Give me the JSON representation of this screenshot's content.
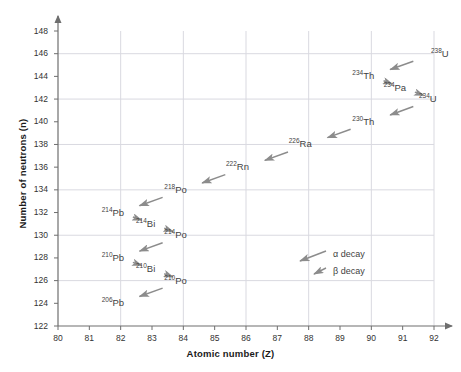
{
  "chart_data": {
    "type": "scatter",
    "title": "",
    "xlabel": "Atomic number (Z)",
    "ylabel": "Number of neutrons (n)",
    "xlim": [
      80,
      92
    ],
    "ylim": [
      122,
      148
    ],
    "xticks": [
      80,
      81,
      82,
      83,
      84,
      85,
      86,
      87,
      88,
      89,
      90,
      91,
      92
    ],
    "yticks": [
      122,
      124,
      126,
      128,
      130,
      132,
      134,
      136,
      138,
      140,
      142,
      144,
      146,
      148
    ],
    "grid": true,
    "legend_position": "inside-lower-right",
    "series": [
      {
        "name": "Uranium-238 decay chain",
        "points": [
          {
            "label": "238 U",
            "mass": "238",
            "symbol": "U",
            "x": 92,
            "y": 146,
            "anchor": "left"
          },
          {
            "label": "234 Th",
            "mass": "234",
            "symbol": "Th",
            "x": 90,
            "y": 144,
            "anchor": "right"
          },
          {
            "label": "234 Pa",
            "mass": "234",
            "symbol": "Pa",
            "x": 91,
            "y": 143,
            "anchor": "right"
          },
          {
            "label": "234 U",
            "mass": "234",
            "symbol": "U",
            "x": 92,
            "y": 142,
            "anchor": "right"
          },
          {
            "label": "230 Th",
            "mass": "230",
            "symbol": "Th",
            "x": 90,
            "y": 140,
            "anchor": "right"
          },
          {
            "label": "226 Ra",
            "mass": "226",
            "symbol": "Ra",
            "x": 88,
            "y": 138,
            "anchor": "right"
          },
          {
            "label": "222 Rn",
            "mass": "222",
            "symbol": "Rn",
            "x": 86,
            "y": 136,
            "anchor": "right"
          },
          {
            "label": "218 Po",
            "mass": "218",
            "symbol": "Po",
            "x": 84,
            "y": 134,
            "anchor": "right"
          },
          {
            "label": "214 Pb",
            "mass": "214",
            "symbol": "Pb",
            "x": 82,
            "y": 132,
            "anchor": "right"
          },
          {
            "label": "214 Bi",
            "mass": "214",
            "symbol": "Bi",
            "x": 83,
            "y": 131,
            "anchor": "right"
          },
          {
            "label": "214 Po",
            "mass": "214",
            "symbol": "Po",
            "x": 84,
            "y": 130,
            "anchor": "right"
          },
          {
            "label": "210 Pb",
            "mass": "210",
            "symbol": "Pb",
            "x": 82,
            "y": 128,
            "anchor": "right"
          },
          {
            "label": "210 Bi",
            "mass": "210",
            "symbol": "Bi",
            "x": 83,
            "y": 127,
            "anchor": "right"
          },
          {
            "label": "210 Po",
            "mass": "210",
            "symbol": "Po",
            "x": 84,
            "y": 126,
            "anchor": "right"
          },
          {
            "label": "206 Pb",
            "mass": "206",
            "symbol": "Pb",
            "x": 82,
            "y": 124,
            "anchor": "right"
          }
        ],
        "transitions": [
          {
            "from": "238 U",
            "to": "234 Th",
            "x1": 92,
            "y1": 146,
            "x2": 90,
            "y2": 144,
            "decay": "alpha"
          },
          {
            "from": "234 Th",
            "to": "234 Pa",
            "x1": 90,
            "y1": 144,
            "x2": 91,
            "y2": 143,
            "decay": "beta"
          },
          {
            "from": "234 Pa",
            "to": "234 U",
            "x1": 91,
            "y1": 143,
            "x2": 92,
            "y2": 142,
            "decay": "beta"
          },
          {
            "from": "234 U",
            "to": "230 Th",
            "x1": 92,
            "y1": 142,
            "x2": 90,
            "y2": 140,
            "decay": "alpha"
          },
          {
            "from": "230 Th",
            "to": "226 Ra",
            "x1": 90,
            "y1": 140,
            "x2": 88,
            "y2": 138,
            "decay": "alpha"
          },
          {
            "from": "226 Ra",
            "to": "222 Rn",
            "x1": 88,
            "y1": 138,
            "x2": 86,
            "y2": 136,
            "decay": "alpha"
          },
          {
            "from": "222 Rn",
            "to": "218 Po",
            "x1": 86,
            "y1": 136,
            "x2": 84,
            "y2": 134,
            "decay": "alpha"
          },
          {
            "from": "218 Po",
            "to": "214 Pb",
            "x1": 84,
            "y1": 134,
            "x2": 82,
            "y2": 132,
            "decay": "alpha"
          },
          {
            "from": "214 Pb",
            "to": "214 Bi",
            "x1": 82,
            "y1": 132,
            "x2": 83,
            "y2": 131,
            "decay": "beta"
          },
          {
            "from": "214 Bi",
            "to": "214 Po",
            "x1": 83,
            "y1": 131,
            "x2": 84,
            "y2": 130,
            "decay": "beta"
          },
          {
            "from": "214 Po",
            "to": "210 Pb",
            "x1": 84,
            "y1": 130,
            "x2": 82,
            "y2": 128,
            "decay": "alpha"
          },
          {
            "from": "210 Pb",
            "to": "210 Bi",
            "x1": 82,
            "y1": 128,
            "x2": 83,
            "y2": 127,
            "decay": "beta"
          },
          {
            "from": "210 Bi",
            "to": "210 Po",
            "x1": 83,
            "y1": 127,
            "x2": 84,
            "y2": 126,
            "decay": "beta"
          },
          {
            "from": "210 Po",
            "to": "206 Pb",
            "x1": 84,
            "y1": 126,
            "x2": 82,
            "y2": 124,
            "decay": "alpha"
          }
        ]
      }
    ],
    "legend": [
      {
        "key": "alpha",
        "label": "α decay",
        "arrow": "long"
      },
      {
        "key": "beta",
        "label": "β decay",
        "arrow": "short"
      }
    ],
    "colors": {
      "arrow": "#8c8c8c",
      "grid": "#d9d9e0",
      "axis": "#6e6e6e",
      "text": "#3f3f3f",
      "tick_text": "#333333",
      "background": "#ffffff"
    }
  }
}
